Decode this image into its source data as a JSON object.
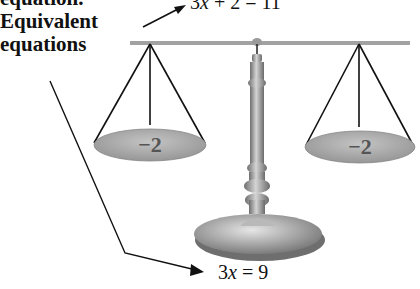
{
  "labels": {
    "cut_top": "equation.",
    "title_line1": "Equivalent",
    "title_line2": "equations"
  },
  "equations": {
    "top": {
      "coef": "3",
      "var": "x",
      "rest": " + 2 = 11"
    },
    "bottom": {
      "coef": "3",
      "var": "x",
      "rest": " = 9"
    }
  },
  "pans": {
    "left": "−2",
    "right": "−2"
  },
  "colors": {
    "pan_fill": "#a9a9a9",
    "beam": "#9a9a9a",
    "stand": "#8c8c8c",
    "text": "#111111"
  }
}
